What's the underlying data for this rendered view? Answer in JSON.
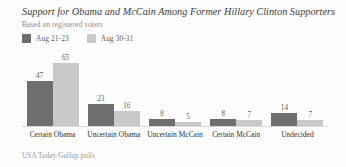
{
  "colors": {
    "series_1": "#6e6e6e",
    "series_2": "#c9c9c9",
    "background": "#fdfdfd",
    "title_text": "#3a3a3a",
    "subtitle_text": "#8d8d8d",
    "label_text": "#2e2e2e",
    "value_text": "#5d5d5d",
    "baseline": "#d8d8d8",
    "source_text": "#9a9a9a"
  },
  "header": {
    "title": "Support for Obama and McCain Among Former Hillary Clinton Supporters",
    "subtitle": "Based on registered voters"
  },
  "source": {
    "text": "USA Today/Gallup polls"
  },
  "chart_data": {
    "type": "bar",
    "title": "Support for Obama and McCain Among Former Hillary Clinton Supporters",
    "subtitle": "Based on registered voters",
    "xlabel": "",
    "ylabel": "",
    "ylim": [
      0,
      65
    ],
    "grid": false,
    "legend_position": "top-left",
    "categories": [
      "Certain Obama",
      "Uncertain Obama",
      "Uncertain McCain",
      "Certain McCain",
      "Undecided"
    ],
    "series": [
      {
        "name": "Aug 21-23",
        "color": "#6e6e6e",
        "values": [
          47,
          23,
          8,
          8,
          14
        ]
      },
      {
        "name": "Aug 30-31",
        "color": "#c9c9c9",
        "values": [
          65,
          16,
          5,
          7,
          7
        ]
      }
    ]
  }
}
